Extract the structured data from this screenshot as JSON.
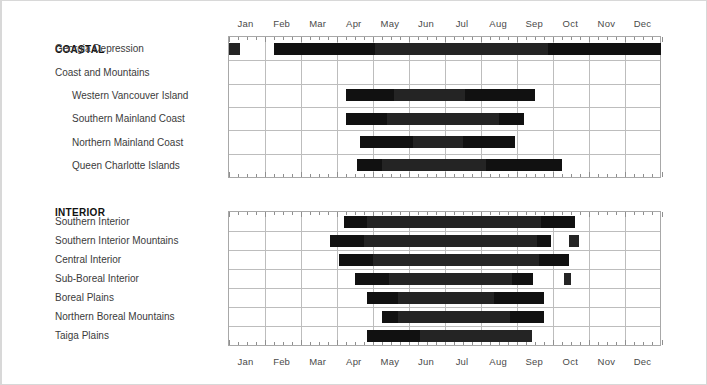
{
  "axis": {
    "months": [
      "Jan",
      "Feb",
      "Mar",
      "Apr",
      "May",
      "Jun",
      "Jul",
      "Aug",
      "Sep",
      "Oct",
      "Nov",
      "Dec"
    ],
    "top_axis_visible": true,
    "bottom_axis_visible": true,
    "range_start": "Jan",
    "range_end": "Dec"
  },
  "panels": [
    {
      "id": "coastal",
      "heading": "COASTAL",
      "rows": [
        {
          "label": "Georgia Depression",
          "indent": 0
        },
        {
          "label": "Coast and Mountains",
          "indent": 0
        },
        {
          "label": "Western Vancouver Island",
          "indent": 1
        },
        {
          "label": "Southern Mainland Coast",
          "indent": 1
        },
        {
          "label": "Northern Mainland Coast",
          "indent": 1
        },
        {
          "label": "Queen Charlotte Islands",
          "indent": 1
        }
      ]
    },
    {
      "id": "interior",
      "heading": "INTERIOR",
      "rows": [
        {
          "label": "Southern Interior",
          "indent": 0
        },
        {
          "label": "Southern Interior Mountains",
          "indent": 0
        },
        {
          "label": "Central Interior",
          "indent": 0
        },
        {
          "label": "Sub-Boreal Interior",
          "indent": 0
        },
        {
          "label": "Boreal Plains",
          "indent": 0
        },
        {
          "label": "Northern Boreal Mountains",
          "indent": 0
        },
        {
          "label": "Taiga Plains",
          "indent": 0
        }
      ]
    }
  ],
  "colors": {
    "bar": "#242424",
    "bar_segment": "#111111",
    "grid": "#bdbdbd",
    "panel_border": "#a8a8a8",
    "text": "#3b3b3b",
    "heading": "#111111",
    "frame": "#d8d8d8"
  },
  "chart_data": {
    "type": "bar",
    "orientation": "horizontal",
    "subtype": "gantt-timeline",
    "title": "",
    "xlabel": "",
    "ylabel": "",
    "xlim": [
      0,
      12
    ],
    "x_unit": "month",
    "x_tick_labels": [
      "Jan",
      "Feb",
      "Mar",
      "Apr",
      "May",
      "Jun",
      "Jul",
      "Aug",
      "Sep",
      "Oct",
      "Nov",
      "Dec"
    ],
    "grid": true,
    "legend": "none",
    "groups": [
      {
        "name": "COASTAL",
        "categories": [
          {
            "name": "Georgia Depression",
            "spans": [
              {
                "start": 0.0,
                "end": 0.33
              },
              {
                "start": 1.25,
                "end": 12.0,
                "segments": [
                  {
                    "start": 1.25,
                    "end": 4.05
                  },
                  {
                    "start": 8.85,
                    "end": 12.0
                  }
                ]
              }
            ]
          },
          {
            "name": "Coast and Mountains",
            "spans": []
          },
          {
            "name": "Western Vancouver Island",
            "spans": [
              {
                "start": 3.25,
                "end": 8.5,
                "segments": [
                  {
                    "start": 3.25,
                    "end": 4.6
                  },
                  {
                    "start": 6.55,
                    "end": 8.5
                  }
                ]
              }
            ]
          },
          {
            "name": "Southern Mainland Coast",
            "spans": [
              {
                "start": 3.25,
                "end": 8.2,
                "segments": [
                  {
                    "start": 3.25,
                    "end": 4.4
                  },
                  {
                    "start": 7.5,
                    "end": 8.2
                  }
                ]
              }
            ]
          },
          {
            "name": "Northern Mainland Coast",
            "spans": [
              {
                "start": 3.65,
                "end": 7.95,
                "segments": [
                  {
                    "start": 3.65,
                    "end": 5.1
                  },
                  {
                    "start": 6.5,
                    "end": 7.95
                  }
                ]
              }
            ]
          },
          {
            "name": "Queen Charlotte Islands",
            "spans": [
              {
                "start": 3.55,
                "end": 9.25,
                "segments": [
                  {
                    "start": 3.55,
                    "end": 4.25
                  },
                  {
                    "start": 7.15,
                    "end": 9.25
                  }
                ]
              }
            ]
          }
        ]
      },
      {
        "name": "INTERIOR",
        "categories": [
          {
            "name": "Southern Interior",
            "spans": [
              {
                "start": 3.2,
                "end": 9.6,
                "segments": [
                  {
                    "start": 3.2,
                    "end": 3.85
                  },
                  {
                    "start": 8.65,
                    "end": 9.6
                  }
                ]
              }
            ]
          },
          {
            "name": "Southern Interior Mountains",
            "spans": [
              {
                "start": 2.8,
                "end": 8.95,
                "segments": [
                  {
                    "start": 2.8,
                    "end": 3.75
                  },
                  {
                    "start": 8.55,
                    "end": 8.95
                  }
                ]
              },
              {
                "start": 9.45,
                "end": 9.7
              }
            ]
          },
          {
            "name": "Central Interior",
            "spans": [
              {
                "start": 3.05,
                "end": 9.45,
                "segments": [
                  {
                    "start": 3.05,
                    "end": 4.0
                  },
                  {
                    "start": 8.6,
                    "end": 9.45
                  }
                ]
              }
            ]
          },
          {
            "name": "Sub-Boreal Interior",
            "spans": [
              {
                "start": 3.5,
                "end": 8.45,
                "segments": [
                  {
                    "start": 3.5,
                    "end": 4.45
                  },
                  {
                    "start": 7.85,
                    "end": 8.45
                  }
                ]
              },
              {
                "start": 9.3,
                "end": 9.5
              }
            ]
          },
          {
            "name": "Boreal Plains",
            "spans": [
              {
                "start": 3.85,
                "end": 8.75,
                "segments": [
                  {
                    "start": 3.85,
                    "end": 4.7
                  },
                  {
                    "start": 7.35,
                    "end": 8.75
                  }
                ]
              }
            ]
          },
          {
            "name": "Northern Boreal Mountains",
            "spans": [
              {
                "start": 4.25,
                "end": 8.75,
                "segments": [
                  {
                    "start": 4.25,
                    "end": 4.7
                  },
                  {
                    "start": 7.8,
                    "end": 8.75
                  }
                ]
              }
            ]
          },
          {
            "name": "Taiga Plains",
            "spans": [
              {
                "start": 3.85,
                "end": 8.4,
                "segments": [
                  {
                    "start": 3.85,
                    "end": 5.3
                  }
                ]
              }
            ]
          }
        ]
      }
    ]
  }
}
